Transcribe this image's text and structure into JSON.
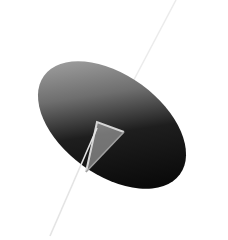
{
  "scene": {
    "description": "3D rendered cone viewed from an oblique angle with a thin axis line passing through its apex",
    "background_color": "#ffffff",
    "cone": {
      "base_colors": {
        "light": "#9a9a9a",
        "mid": "#4a4a4a",
        "dark": "#050505"
      },
      "apex_color": "#d8d8d8"
    },
    "axis_line": {
      "color": "#f2f2f2"
    }
  }
}
